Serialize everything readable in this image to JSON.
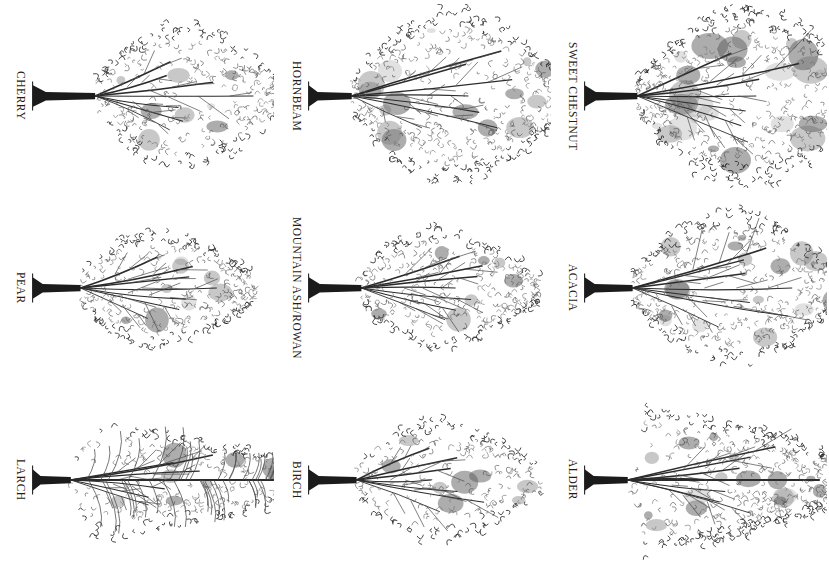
{
  "plate": {
    "title": "Tree silhouette identification plate",
    "background_color": "#ffffff",
    "ink_color": "#2b2b2b",
    "orientation_note": "Plate rotated 90 degrees; captions read top-to-bottom",
    "columns": 3,
    "rows": 3
  },
  "figures": [
    {
      "label": "CHERRY",
      "row": 1,
      "column": 1,
      "crown_shape": "rounded",
      "crown_width": 0.78,
      "crown_height": 0.74,
      "trunk_length": 0.26,
      "density": "medium",
      "tone": "light"
    },
    {
      "label": "HORNBEAM",
      "row": 1,
      "column": 2,
      "crown_shape": "broad-rounded",
      "crown_width": 0.88,
      "crown_height": 0.88,
      "trunk_length": 0.18,
      "density": "dense",
      "tone": "medium"
    },
    {
      "label": "SWEET CHESTNUT",
      "row": 1,
      "column": 3,
      "crown_shape": "broad-spreading",
      "crown_width": 0.95,
      "crown_height": 0.9,
      "trunk_length": 0.22,
      "density": "very-dense",
      "tone": "dark"
    },
    {
      "label": "PEAR",
      "row": 2,
      "column": 1,
      "crown_shape": "ovate",
      "crown_width": 0.72,
      "crown_height": 0.6,
      "trunk_length": 0.2,
      "density": "medium",
      "tone": "light"
    },
    {
      "label": "MOUNTAIN ASH/ROWAN",
      "row": 2,
      "column": 2,
      "crown_shape": "ovate-pointed",
      "crown_width": 0.74,
      "crown_height": 0.62,
      "trunk_length": 0.22,
      "density": "medium",
      "tone": "light"
    },
    {
      "label": "ACACIA",
      "row": 2,
      "column": 3,
      "crown_shape": "rounded-irregular",
      "crown_width": 0.86,
      "crown_height": 0.78,
      "trunk_length": 0.2,
      "density": "dense",
      "tone": "medium"
    },
    {
      "label": "LARCH",
      "row": 3,
      "column": 1,
      "crown_shape": "narrow-conical",
      "crown_width": 0.95,
      "crown_height": 0.56,
      "trunk_length": 0.16,
      "density": "feathery",
      "tone": "light"
    },
    {
      "label": "BIRCH",
      "row": 3,
      "column": 2,
      "crown_shape": "ovate-open",
      "crown_width": 0.76,
      "crown_height": 0.62,
      "trunk_length": 0.2,
      "density": "open",
      "tone": "light"
    },
    {
      "label": "ALDER",
      "row": 3,
      "column": 3,
      "crown_shape": "conical",
      "crown_width": 0.86,
      "crown_height": 0.74,
      "trunk_length": 0.18,
      "density": "dense",
      "tone": "medium"
    }
  ]
}
